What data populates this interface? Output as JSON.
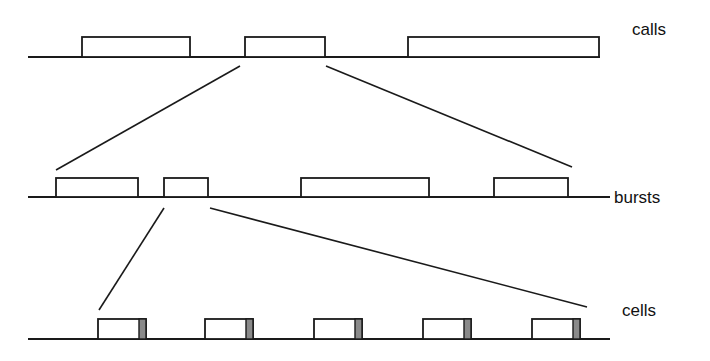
{
  "labels": {
    "calls": "calls",
    "bursts": "bursts",
    "cells": "cells"
  },
  "colors": {
    "stroke": "#1a1a1a",
    "cell_tail": "#8a8a8a",
    "background": "#ffffff"
  },
  "levels": {
    "calls": {
      "baseline_y": 57,
      "box_top": 37,
      "x_start": 28,
      "x_end": 600,
      "boxes": [
        [
          82,
          190
        ],
        [
          245,
          325
        ],
        [
          408,
          599
        ]
      ]
    },
    "bursts": {
      "baseline_y": 197,
      "box_top": 178,
      "x_start": 28,
      "x_end": 610,
      "boxes": [
        [
          56,
          138
        ],
        [
          164,
          208
        ],
        [
          301,
          429
        ],
        [
          494,
          568
        ]
      ]
    },
    "cells": {
      "baseline_y": 339,
      "box_top": 319,
      "x_start": 28,
      "x_end": 610,
      "boxes": [
        [
          98,
          146
        ],
        [
          205,
          253
        ],
        [
          314,
          362
        ],
        [
          423,
          471
        ],
        [
          532,
          580
        ]
      ],
      "tail_width": 7
    }
  },
  "zoom_lines": [
    [
      [
        240,
        66
      ],
      [
        56,
        170
      ]
    ],
    [
      [
        326,
        66
      ],
      [
        572,
        167
      ]
    ],
    [
      [
        164,
        208
      ],
      [
        99,
        310
      ]
    ],
    [
      [
        210,
        208
      ],
      [
        587,
        307
      ]
    ]
  ]
}
